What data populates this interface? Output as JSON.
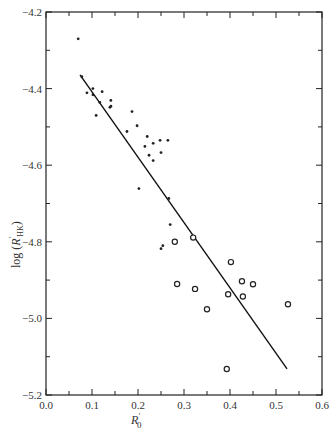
{
  "chart_data": {
    "type": "scatter",
    "title": "",
    "xlabel": "R'0",
    "ylabel": "log (R'HK)",
    "xlim": [
      0.0,
      0.6
    ],
    "ylim": [
      -5.2,
      -4.2
    ],
    "grid": false,
    "legend": null,
    "x_ticks_major": [
      "0.0",
      "0.1",
      "0.2",
      "0.3",
      "0.4",
      "0.5",
      "0.6"
    ],
    "y_ticks_major": [
      "-4.2",
      "-4.4",
      "-4.6",
      "-4.8",
      "-5.0",
      "-5.2"
    ],
    "series": [
      {
        "name": "filled dots",
        "marker": "dot",
        "points": [
          [
            0.07,
            -4.27
          ],
          [
            0.078,
            -4.369
          ],
          [
            0.089,
            -4.411
          ],
          [
            0.102,
            -4.4
          ],
          [
            0.102,
            -4.416
          ],
          [
            0.122,
            -4.408
          ],
          [
            0.117,
            -4.436
          ],
          [
            0.141,
            -4.431
          ],
          [
            0.141,
            -4.446
          ],
          [
            0.139,
            -4.449
          ],
          [
            0.109,
            -4.47
          ],
          [
            0.187,
            -4.46
          ],
          [
            0.198,
            -4.497
          ],
          [
            0.176,
            -4.512
          ],
          [
            0.22,
            -4.525
          ],
          [
            0.233,
            -4.543
          ],
          [
            0.248,
            -4.535
          ],
          [
            0.265,
            -4.535
          ],
          [
            0.215,
            -4.551
          ],
          [
            0.25,
            -4.567
          ],
          [
            0.224,
            -4.574
          ],
          [
            0.233,
            -4.588
          ],
          [
            0.202,
            -4.661
          ],
          [
            0.267,
            -4.687
          ],
          [
            0.27,
            -4.755
          ],
          [
            0.254,
            -4.81
          ],
          [
            0.25,
            -4.818
          ]
        ]
      },
      {
        "name": "open circles",
        "marker": "circle",
        "points": [
          [
            0.28,
            -4.8
          ],
          [
            0.32,
            -4.789
          ],
          [
            0.402,
            -4.853
          ],
          [
            0.285,
            -4.91
          ],
          [
            0.324,
            -4.923
          ],
          [
            0.35,
            -4.976
          ],
          [
            0.396,
            -4.937
          ],
          [
            0.426,
            -4.903
          ],
          [
            0.428,
            -4.943
          ],
          [
            0.45,
            -4.911
          ],
          [
            0.526,
            -4.963
          ],
          [
            0.393,
            -5.132
          ]
        ]
      }
    ],
    "fit_line": {
      "x": [
        0.074,
        0.524
      ],
      "y": [
        -4.364,
        -5.132
      ]
    }
  },
  "axes": {
    "x_label_main": "R",
    "x_label_sup": "'",
    "x_label_sub": "0",
    "y_label_prefix": "log (",
    "y_label_main": "R",
    "y_label_sup": "'",
    "y_label_sub": "HK",
    "y_label_suffix": ")"
  }
}
